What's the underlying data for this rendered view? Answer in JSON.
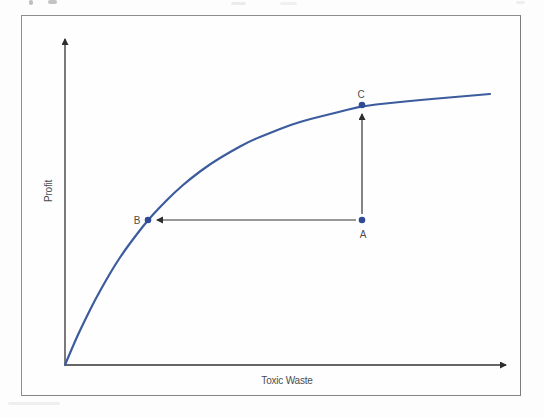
{
  "chart_data": {
    "type": "line",
    "title": "",
    "xlabel": "Toxic Waste",
    "ylabel": "Profit",
    "axis_ticks": "none",
    "legend": "none",
    "curve": {
      "name": "profit-curve",
      "points_px": [
        [
          65,
          365
        ],
        [
          75,
          341
        ],
        [
          85,
          320
        ],
        [
          95,
          300
        ],
        [
          105,
          282
        ],
        [
          115,
          265
        ],
        [
          125,
          250
        ],
        [
          137,
          234
        ],
        [
          148,
          220
        ],
        [
          160,
          207
        ],
        [
          175,
          192
        ],
        [
          190,
          179
        ],
        [
          210,
          164
        ],
        [
          230,
          152
        ],
        [
          250,
          141
        ],
        [
          270,
          133
        ],
        [
          290,
          125
        ],
        [
          310,
          119
        ],
        [
          335,
          113
        ],
        [
          362,
          106
        ],
        [
          390,
          103
        ],
        [
          420,
          100
        ],
        [
          455,
          97
        ],
        [
          490,
          94
        ]
      ]
    },
    "points": [
      {
        "id": "A",
        "label": "A",
        "x": 362,
        "y": 220,
        "on_curve": false,
        "label_offset": [
          1,
          14
        ]
      },
      {
        "id": "B",
        "label": "B",
        "x": 148,
        "y": 220,
        "on_curve": true,
        "label_offset": [
          -11,
          0
        ]
      },
      {
        "id": "C",
        "label": "C",
        "x": 362,
        "y": 105,
        "on_curve": true,
        "label_offset": [
          -1,
          -11
        ]
      }
    ],
    "arrows": [
      {
        "from": "A",
        "to": "C"
      },
      {
        "from": "A",
        "to": "B"
      }
    ],
    "colors": {
      "curve": "#3c5c9e",
      "point": "#2e4b94",
      "axis": "#333333",
      "frame": "#8f8f8f",
      "label": "#4c4c4c"
    }
  }
}
